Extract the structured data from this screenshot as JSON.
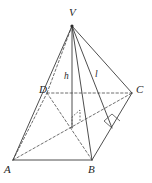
{
  "figure": {
    "kind": "geometry-diagram",
    "width": 152,
    "height": 183,
    "background_color": "#ffffff",
    "stroke_color": "#3a3a3a",
    "label_color": "#262626"
  },
  "vertices": [
    {
      "name": "apex",
      "label": "V",
      "x": 72,
      "y": 26,
      "label_x": 69,
      "label_y": 7
    },
    {
      "name": "base-front-left",
      "label": "A",
      "x": 13,
      "y": 160,
      "label_x": 4,
      "label_y": 164
    },
    {
      "name": "base-front-right",
      "label": "B",
      "x": 92,
      "y": 160,
      "label_x": 88,
      "label_y": 164
    },
    {
      "name": "base-back-right",
      "label": "C",
      "x": 132,
      "y": 93,
      "label_x": 136,
      "label_y": 84
    },
    {
      "name": "base-back-left",
      "label": "D",
      "x": 47,
      "y": 93,
      "label_x": 39,
      "label_y": 84
    }
  ],
  "measures": [
    {
      "name": "height",
      "label": "h",
      "from_x": 72,
      "from_y": 26,
      "to_x": 72,
      "to_y": 128,
      "label_x": 64,
      "label_y": 72,
      "style": "solid"
    },
    {
      "name": "slant-height",
      "label": "l",
      "from_x": 72,
      "from_y": 26,
      "to_x": 112,
      "to_y": 128,
      "label_x": 95,
      "label_y": 70,
      "style": "solid"
    }
  ],
  "edges": {
    "solid": [
      {
        "name": "edge-V-A",
        "x1": 72,
        "y1": 26,
        "x2": 13,
        "y2": 160
      },
      {
        "name": "edge-V-B",
        "x1": 72,
        "y1": 26,
        "x2": 92,
        "y2": 160
      },
      {
        "name": "edge-V-C",
        "x1": 72,
        "y1": 26,
        "x2": 132,
        "y2": 93
      },
      {
        "name": "edge-A-B",
        "x1": 13,
        "y1": 160,
        "x2": 92,
        "y2": 160
      },
      {
        "name": "edge-B-C",
        "x1": 92,
        "y1": 160,
        "x2": 132,
        "y2": 93
      }
    ],
    "dashed": [
      {
        "name": "edge-V-D",
        "x1": 72,
        "y1": 26,
        "x2": 47,
        "y2": 93
      },
      {
        "name": "edge-D-C",
        "x1": 47,
        "y1": 93,
        "x2": 132,
        "y2": 93
      },
      {
        "name": "edge-A-D",
        "x1": 13,
        "y1": 160,
        "x2": 47,
        "y2": 93
      },
      {
        "name": "diagonal-D-B",
        "x1": 47,
        "y1": 93,
        "x2": 92,
        "y2": 160
      },
      {
        "name": "diagonal-A-C",
        "x1": 13,
        "y1": 160,
        "x2": 132,
        "y2": 93
      }
    ]
  },
  "right_angle_marks": [
    {
      "name": "right-angle-at-height-foot",
      "points": "72,128 72,117 80,110 80,121",
      "style": "dashed"
    },
    {
      "name": "right-angle-at-slant-foot",
      "points": "112,128 104,121 112,114 120,121",
      "style": "solid"
    }
  ],
  "notes": {
    "figure_caption": ""
  }
}
